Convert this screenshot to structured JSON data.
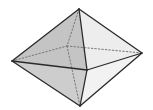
{
  "diagram": {
    "type": "octahedron",
    "vertices": {
      "top": [
        79,
        9
      ],
      "left": [
        12,
        61
      ],
      "right": [
        142,
        53
      ],
      "bottom": [
        80,
        106
      ],
      "front": [
        87,
        70
      ],
      "back": [
        67,
        46
      ]
    },
    "faces": [
      {
        "name": "upper-left-front",
        "points": [
          "top",
          "left",
          "front"
        ],
        "fill": "#c4c4c4"
      },
      {
        "name": "upper-right-front",
        "points": [
          "top",
          "front",
          "right"
        ],
        "fill": "#ededed"
      },
      {
        "name": "lower-left-front",
        "points": [
          "left",
          "front",
          "bottom"
        ],
        "fill": "#cdcdcd"
      },
      {
        "name": "lower-right-front",
        "points": [
          "front",
          "right",
          "bottom"
        ],
        "fill": "#f2f2f2"
      }
    ],
    "visible_edges": [
      [
        "top",
        "left"
      ],
      [
        "top",
        "right"
      ],
      [
        "top",
        "front"
      ],
      [
        "left",
        "front"
      ],
      [
        "front",
        "right"
      ],
      [
        "left",
        "bottom"
      ],
      [
        "right",
        "bottom"
      ],
      [
        "front",
        "bottom"
      ]
    ],
    "hidden_edges": [
      [
        "top",
        "back"
      ],
      [
        "left",
        "back"
      ],
      [
        "back",
        "right"
      ],
      [
        "back",
        "bottom"
      ]
    ],
    "colors": {
      "edge": "#2a2a2a",
      "hidden_edge": "#777777",
      "background": "#ffffff"
    }
  }
}
